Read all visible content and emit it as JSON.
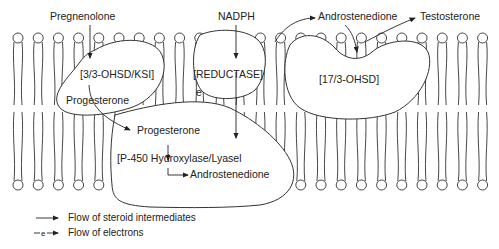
{
  "diagram": {
    "molecules": {
      "pregnenolone": "Pregnenolone",
      "nadph": "NADPH",
      "androstenedione_top": "Androstenedione",
      "testosterone": "Testosterone",
      "progesterone_1": "Progesterone",
      "progesterone_2": "Progesterone",
      "androstenedione_bottom": "Androstenedione",
      "electron": "e"
    },
    "enzymes": {
      "hsd_ksi": "[3/3-OHSD/KSI]",
      "reductase": "[REDUCTASE]",
      "hsd17": "[17/3-OHSD]",
      "p450": "[P-450 Hydroxylase/Lyasel"
    },
    "legend": [
      {
        "symbol": "solid-arrow",
        "label": "Flow of steroid intermediates"
      },
      {
        "symbol": "electron-arrow",
        "symbol_text": "e",
        "label": "Flow of electrons"
      }
    ],
    "colors": {
      "line": "#333333",
      "background": "#ffffff"
    }
  }
}
